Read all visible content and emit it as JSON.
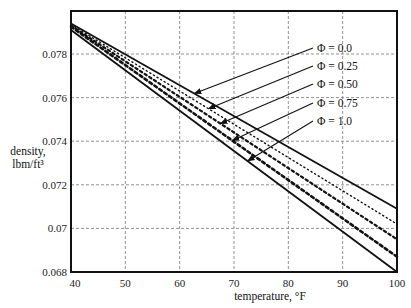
{
  "chart_data": {
    "type": "line",
    "title": "",
    "xlabel": "temperature, °F",
    "ylabel_line1": "density,",
    "ylabel_line2": "lbm/ft³",
    "xlim": [
      40,
      100
    ],
    "ylim": [
      0.068,
      0.0795
    ],
    "grid": true,
    "x_ticks": [
      40,
      50,
      60,
      70,
      80,
      90,
      100
    ],
    "x_tick_labels": [
      "40",
      "50",
      "60",
      "70",
      "80",
      "90",
      "100"
    ],
    "y_ticks": [
      0.068,
      0.07,
      0.072,
      0.074,
      0.076,
      0.078
    ],
    "y_tick_labels": [
      "0.068",
      "0.07",
      "0.072",
      "0.074",
      "0.076",
      "0.078"
    ],
    "x": [
      40,
      100
    ],
    "series": [
      {
        "name": "Φ = 0.0",
        "values": [
          0.0794,
          0.0709
        ],
        "style": "solid"
      },
      {
        "name": "Φ = 0.25",
        "values": [
          0.07935,
          0.0702
        ],
        "style": "dotted"
      },
      {
        "name": "Φ = 0.50",
        "values": [
          0.0793,
          0.0695
        ],
        "style": "dash-dot"
      },
      {
        "name": "Φ = 0.75",
        "values": [
          0.07925,
          0.0687
        ],
        "style": "dashed"
      },
      {
        "name": "Φ = 1.0",
        "values": [
          0.0791,
          0.068
        ],
        "style": "solid"
      }
    ],
    "annotations": [
      {
        "text": "Φ = 0.0",
        "arrow_to_x": 62.7
      },
      {
        "text": "Φ = 0.25",
        "arrow_to_x": 65.3
      },
      {
        "text": "Φ = 0.50",
        "arrow_to_x": 67.5
      },
      {
        "text": "Φ = 0.75",
        "arrow_to_x": 69.7
      },
      {
        "text": "Φ = 1.0",
        "arrow_to_x": 72.5
      }
    ],
    "legend_position": "annotations with arrows, upper right"
  }
}
